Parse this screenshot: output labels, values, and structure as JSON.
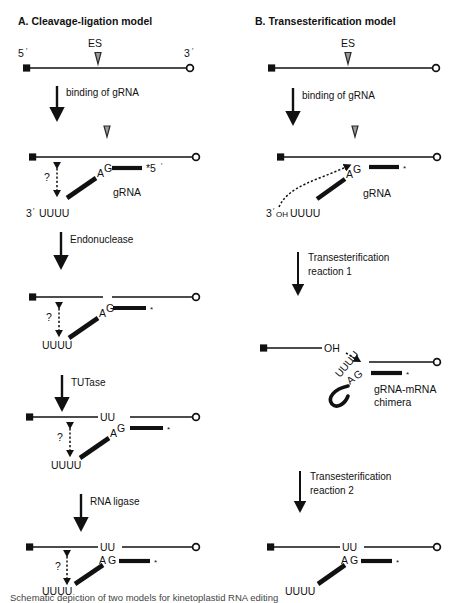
{
  "figure": {
    "panels": [
      {
        "id": "A",
        "title": "A. Cleavage-ligation model",
        "steps": [
          {
            "label": "binding of gRNA"
          },
          {
            "label": "Endonuclease"
          },
          {
            "label": "TUTase"
          },
          {
            "label": "RNA ligase"
          }
        ],
        "structures": [
          {
            "name": "pre-edited-mrna",
            "labels": {
              "five_prime": "5",
              "five_prime_mark": "′",
              "three_prime": "3",
              "three_prime_mark": "′",
              "cleavage_site": "ES"
            }
          },
          {
            "name": "grna-bound-mrna",
            "labels": {
              "anchor_a": "A",
              "anchor_g": "G",
              "grna": "gRNA",
              "grna_end": "*5",
              "grna_end_mark": "′",
              "u_tail": "UUUU",
              "u_tail_prime": "3",
              "u_tail_prime_mark": "′",
              "question": "?",
              "cleavage_site": "ES"
            }
          },
          {
            "name": "cleaved-mrna",
            "labels": {
              "anchor_a": "A",
              "anchor_g": "G",
              "asterisk": "*",
              "u_tail": "UUUU",
              "question": "?"
            }
          },
          {
            "name": "uridylated-mrna",
            "labels": {
              "anchor_a": "A",
              "anchor_g": "G",
              "asterisk": "*",
              "added_u": "UU",
              "u_tail": "UUUU",
              "question": "?"
            }
          },
          {
            "name": "ligated-edited-mrna",
            "labels": {
              "anchor_a": "A",
              "anchor_g": "G",
              "asterisk": "*",
              "added_u": "UU",
              "u_tail": "UUUU",
              "question": "?"
            }
          }
        ]
      },
      {
        "id": "B",
        "title": "B. Transesterification model",
        "steps": [
          {
            "label": "binding of gRNA"
          },
          {
            "label_line1": "Transesterification",
            "label_line2": "reaction 1"
          },
          {
            "label_line1": "Transesterification",
            "label_line2": "reaction 2"
          }
        ],
        "structures": [
          {
            "name": "pre-edited-mrna",
            "labels": {
              "cleavage_site": "ES"
            }
          },
          {
            "name": "grna-bound-mrna",
            "labels": {
              "anchor_a": "A",
              "anchor_g": "G",
              "grna": "gRNA",
              "asterisk": "*",
              "u_tail": "UUUU",
              "u_tail_prime": "3",
              "u_tail_prime_mark": "′",
              "u_tail_oh": "OH",
              "cleavage_site": "ES"
            }
          },
          {
            "name": "grna-mrna-chimera",
            "labels": {
              "anchor_a": "A",
              "anchor_g": "G",
              "asterisk": "*",
              "hydroxyl": "OH",
              "u_tail": "UUUU",
              "chimera_line1": "gRNA-mRNA",
              "chimera_line2": "chimera"
            }
          },
          {
            "name": "edited-mrna",
            "labels": {
              "anchor_a": "A",
              "anchor_g": "G",
              "asterisk": "*",
              "added_u": "UU",
              "u_tail": "UUUU"
            }
          }
        ]
      }
    ],
    "caption": "Schematic depiction of two models for kinetoplastid RNA editing"
  }
}
